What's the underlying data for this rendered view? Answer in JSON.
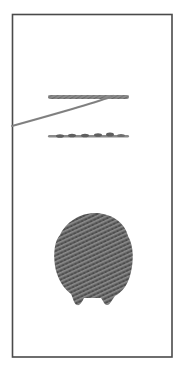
{
  "image": {
    "description": "Scanned embroidery stitch samples inside a thin rectangular frame",
    "background": "#ffffff",
    "frame": {
      "x": 12,
      "y": 14,
      "width": 160,
      "height": 343,
      "stroke": "#4a4a4a"
    },
    "samples": [
      {
        "name": "stem-stitch-line",
        "y": 97,
        "x1": 48,
        "x2": 129,
        "color": "#7a7a7a"
      },
      {
        "name": "thread-tail",
        "from": [
          110,
          96
        ],
        "to": [
          12,
          126
        ],
        "color": "#8a8a8a"
      },
      {
        "name": "back-stitch-line",
        "y": 136,
        "x1": 48,
        "x2": 129,
        "color": "#6e6e6e"
      },
      {
        "name": "filled-stitch-shape",
        "cx": 94,
        "cy": 258,
        "color": "#555555"
      }
    ]
  }
}
